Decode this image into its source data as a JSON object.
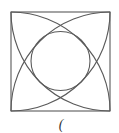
{
  "diagram": {
    "type": "geometric-construction",
    "square": {
      "x": 11,
      "y": 12,
      "size": 99
    },
    "arcs": [
      {
        "center": "top-left",
        "cx": 11,
        "cy": 12,
        "r": 99
      },
      {
        "center": "top-right",
        "cx": 110,
        "cy": 12,
        "r": 99
      },
      {
        "center": "bottom-left",
        "cx": 11,
        "cy": 111,
        "r": 99
      },
      {
        "center": "bottom-right",
        "cx": 110,
        "cy": 111,
        "r": 99
      }
    ],
    "inner_circle": {
      "cx": 60.5,
      "cy": 61,
      "r": 29.5
    },
    "stroke_color": "#5a5a5a",
    "caption": "("
  }
}
